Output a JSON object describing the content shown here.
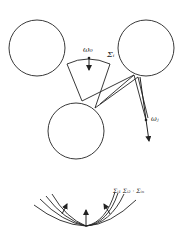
{
  "diagram": {
    "colors": {
      "stroke": "#222222",
      "background": "#ffffff"
    },
    "circles": [
      {
        "name": "left-top",
        "cx": 37,
        "cy": 48,
        "r": 28
      },
      {
        "name": "right-top",
        "cx": 146,
        "cy": 48,
        "r": 28
      },
      {
        "name": "bottom-center",
        "cx": 76,
        "cy": 131,
        "r": 28
      }
    ],
    "labels": {
      "omega0": "ω₀",
      "sigma_i": "Σᵢ",
      "omega_j": "ωⱼ",
      "sigma_series": "Σᵢ₁ Σᵢ₂ · Σᵢₙ"
    }
  }
}
